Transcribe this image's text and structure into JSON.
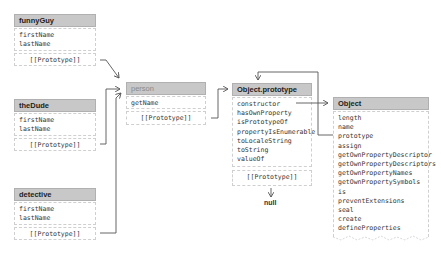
{
  "diagram": {
    "objects": [
      {
        "id": "funnyGuy",
        "title": "funnyGuy",
        "properties": [
          "firstName",
          "lastName"
        ],
        "prototype_label": "[[Prototype]]"
      },
      {
        "id": "theDude",
        "title": "theDude",
        "properties": [
          "firstName",
          "lastName"
        ],
        "prototype_label": "[[Prototype]]"
      },
      {
        "id": "detective",
        "title": "detective",
        "properties": [
          "firstName",
          "lastName"
        ],
        "prototype_label": "[[Prototype]]"
      },
      {
        "id": "person",
        "title": "person",
        "properties": [
          "getName"
        ],
        "prototype_label": "[[Prototype]]"
      },
      {
        "id": "object-prototype",
        "title": "Object.prototype",
        "properties": [
          "constructor",
          "hasOwnProperty",
          "isPrototypeOf",
          "propertyIsEnumerable",
          "toLocaleString",
          "toString",
          "valueOf"
        ],
        "prototype_label": "[[Prototype]]"
      },
      {
        "id": "object",
        "title": "Object",
        "properties": [
          "length",
          "name",
          "prototype",
          "assign",
          "getOwnPropertyDescriptor",
          "getOwnPropertyDescriptors",
          "getOwnPropertyNames",
          "getOwnPropertySymbols",
          "is",
          "preventExtensions",
          "seal",
          "create",
          "defineProperties"
        ]
      }
    ],
    "null_label": "null",
    "links": [
      {
        "from": "funnyGuy.[[Prototype]]",
        "to": "person"
      },
      {
        "from": "theDude.[[Prototype]]",
        "to": "person"
      },
      {
        "from": "detective.[[Prototype]]",
        "to": "person"
      },
      {
        "from": "person.[[Prototype]]",
        "to": "Object.prototype"
      },
      {
        "from": "Object.prototype.constructor",
        "to": "Object"
      },
      {
        "from": "Object.prototype (property)",
        "to": "Object.prototype"
      },
      {
        "from": "Object.prototype.[[Prototype]]",
        "to": "null"
      }
    ],
    "colors": {
      "header_bg": "#c8c8c8",
      "border": "#cfcfcf",
      "line": "#555555"
    }
  }
}
